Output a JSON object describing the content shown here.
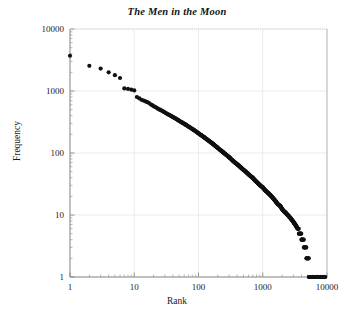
{
  "chart_data": {
    "type": "scatter",
    "title": "The Men in the Moon",
    "xlabel": "Rank",
    "ylabel": "Frequency",
    "xscale": "log",
    "yscale": "log",
    "xlim": [
      1,
      10000
    ],
    "ylim": [
      1,
      10000
    ],
    "grid": true,
    "legend": null,
    "xticks": [
      "1",
      "10",
      "100",
      "1000",
      "10000"
    ],
    "xtick_values": [
      1,
      10,
      100,
      1000,
      10000
    ],
    "yticks": [
      "1",
      "10",
      "100",
      "1000",
      "10000"
    ],
    "ytick_values": [
      1,
      10,
      100,
      1000,
      10000
    ],
    "marker": "filled-circle",
    "marker_color": "#111111",
    "marker_size": 3.1,
    "series": [
      {
        "name": "word frequency",
        "points": [
          [
            1,
            3700
          ],
          [
            2,
            2550
          ],
          [
            3,
            2300
          ],
          [
            4,
            2000
          ],
          [
            5,
            1800
          ],
          [
            6,
            1620
          ],
          [
            7,
            1100
          ],
          [
            8,
            1080
          ],
          [
            9,
            1050
          ],
          [
            10,
            1020
          ],
          [
            11,
            800
          ],
          [
            12,
            760
          ],
          [
            13,
            720
          ],
          [
            14,
            700
          ],
          [
            15,
            680
          ],
          [
            16,
            660
          ],
          [
            17,
            640
          ],
          [
            18,
            610
          ],
          [
            19,
            590
          ],
          [
            20,
            570
          ],
          [
            22,
            540
          ],
          [
            24,
            510
          ],
          [
            26,
            490
          ],
          [
            28,
            470
          ],
          [
            30,
            450
          ],
          [
            33,
            425
          ],
          [
            36,
            405
          ],
          [
            40,
            380
          ],
          [
            44,
            360
          ],
          [
            48,
            340
          ],
          [
            52,
            322
          ],
          [
            57,
            305
          ],
          [
            62,
            290
          ],
          [
            68,
            272
          ],
          [
            74,
            258
          ],
          [
            80,
            244
          ],
          [
            88,
            228
          ],
          [
            96,
            214
          ],
          [
            105,
            200
          ],
          [
            115,
            188
          ],
          [
            125,
            176
          ],
          [
            137,
            164
          ],
          [
            150,
            153
          ],
          [
            165,
            142
          ],
          [
            180,
            132
          ],
          [
            197,
            122
          ],
          [
            215,
            113
          ],
          [
            236,
            105
          ],
          [
            258,
            97
          ],
          [
            282,
            90
          ],
          [
            309,
            83
          ],
          [
            338,
            76
          ],
          [
            370,
            70
          ],
          [
            405,
            65
          ],
          [
            443,
            60
          ],
          [
            485,
            55
          ],
          [
            530,
            51
          ],
          [
            580,
            47
          ],
          [
            635,
            43
          ],
          [
            695,
            40
          ],
          [
            760,
            36
          ],
          [
            832,
            33
          ],
          [
            910,
            30
          ],
          [
            996,
            28
          ],
          [
            1090,
            25
          ],
          [
            1193,
            23
          ],
          [
            1305,
            21
          ],
          [
            1428,
            19
          ],
          [
            1562,
            17
          ],
          [
            1709,
            15
          ],
          [
            1870,
            14
          ],
          [
            2046,
            12
          ],
          [
            2239,
            11
          ],
          [
            2450,
            10
          ],
          [
            2680,
            9
          ],
          [
            2930,
            8
          ],
          [
            3205,
            7
          ],
          [
            3507,
            6
          ],
          [
            3837,
            5
          ],
          [
            4198,
            4
          ],
          [
            4593,
            3
          ],
          [
            5025,
            2
          ],
          [
            5497,
            1
          ],
          [
            6015,
            1
          ],
          [
            6580,
            1
          ],
          [
            7200,
            1
          ],
          [
            7880,
            1
          ],
          [
            8620,
            1
          ],
          [
            9430,
            1
          ]
        ],
        "note": "dense power-law cloud; lower tail quantized at integer counts 1-5 forming horizontal steps"
      }
    ]
  },
  "figure": {
    "background": "#ffffff",
    "axis_color": "#8a8a8a",
    "grid_color": "#e3e3e3",
    "text_color": "#1a1a1a"
  }
}
